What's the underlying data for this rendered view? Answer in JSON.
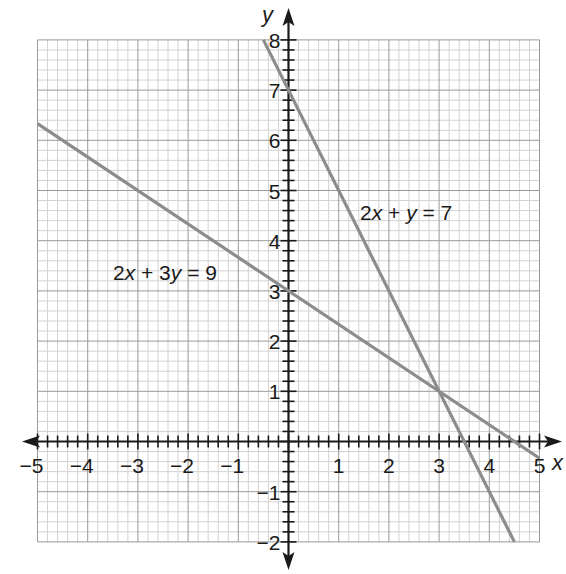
{
  "chart_data": {
    "type": "line",
    "title": "",
    "xlabel": "x",
    "ylabel": "y",
    "xlim": [
      -5,
      5
    ],
    "ylim": [
      -2,
      8
    ],
    "grid": true,
    "minor_grid_step": 0.2,
    "major_grid_step": 1,
    "x_ticks": [
      -5,
      -4,
      -3,
      -2,
      -1,
      0,
      1,
      2,
      3,
      4,
      5
    ],
    "x_tick_labels": [
      "−5",
      "−4",
      "−3",
      "−2",
      "−1",
      "0",
      "1",
      "2",
      "3",
      "4",
      "5"
    ],
    "y_ticks": [
      -2,
      -1,
      1,
      2,
      3,
      4,
      5,
      6,
      7,
      8
    ],
    "y_tick_labels": [
      "−2",
      "−1",
      "1",
      "2",
      "3",
      "4",
      "5",
      "6",
      "7",
      "8"
    ],
    "series": [
      {
        "name": "2x + y = 7",
        "equation": "y = 7 - 2x",
        "x": [
          -0.5,
          4.5
        ],
        "y": [
          8,
          -2
        ],
        "color": "#8c8c8c",
        "label_position": [
          1.5,
          4.5
        ]
      },
      {
        "name": "2x + 3y = 9",
        "equation": "y = 3 - (2/3)x",
        "x": [
          -5,
          5
        ],
        "y": [
          6.333,
          -0.333
        ],
        "color": "#8c8c8c",
        "label_position": [
          -3.5,
          3.3
        ]
      }
    ],
    "annotations": [
      {
        "text": "2x + y = 7",
        "x": 1.5,
        "y": 4.5
      },
      {
        "text": "2x + 3y = 9",
        "x": -3.5,
        "y": 3.3
      }
    ],
    "intersection": {
      "x": 3,
      "y": 1
    }
  },
  "labels": {
    "x_axis": "x",
    "y_axis": "y",
    "eq1_coef": "2",
    "eq1_var1": "x",
    "eq1_mid": " + ",
    "eq1_var2": "y",
    "eq1_rhs": " = 7",
    "eq2_coef": "2",
    "eq2_var1": "x",
    "eq2_mid": " + 3",
    "eq2_var2": "y",
    "eq2_rhs": " = 9"
  }
}
